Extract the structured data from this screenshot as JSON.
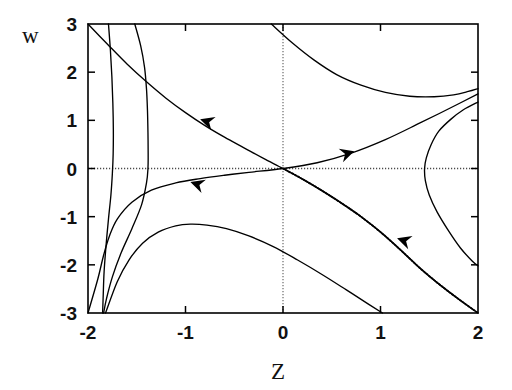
{
  "figure": {
    "name": "phase-portrait",
    "background": "#ffffff",
    "line_color": "#000000",
    "axis_color": "#000000",
    "zero_line_color": "#555555"
  },
  "axes": {
    "xlabel": "Z",
    "ylabel": "w",
    "xticks": [
      "-2",
      "-1",
      "0",
      "1",
      "2"
    ],
    "yticks": [
      "3",
      "2",
      "1",
      "0",
      "-1",
      "-2",
      "-3"
    ],
    "xlim": [
      -2,
      2
    ],
    "ylim": [
      -3,
      3
    ],
    "frame": {
      "left": 88,
      "right": 478,
      "top": 24,
      "bottom": 313
    }
  },
  "chart_data": {
    "type": "line",
    "title": "",
    "xlabel": "Z",
    "ylabel": "w",
    "xlim": [
      -2,
      2
    ],
    "ylim": [
      -3,
      3
    ],
    "grid": false,
    "legend": "none",
    "zero_lines": {
      "horizontal_w": 0,
      "vertical_z": 0,
      "style": "dotted"
    },
    "fixed_point": {
      "z": 0,
      "w": 0,
      "kind": "saddle"
    },
    "annotations": [
      {
        "name": "arrow-upper-left",
        "z": -0.85,
        "w": 1.02,
        "direction": "down-left"
      },
      {
        "name": "arrow-right",
        "z": 0.73,
        "w": 0.36,
        "direction": "right-up"
      },
      {
        "name": "arrow-lower-left",
        "z": -0.95,
        "w": -0.28,
        "direction": "down-left"
      },
      {
        "name": "arrow-separatrix",
        "z": 1.17,
        "w": -1.45,
        "direction": "down-left"
      }
    ],
    "series": [
      {
        "name": "separatrix-stable-branch",
        "style": "solid",
        "points": [
          [
            -2,
            3.0
          ],
          [
            -1.8,
            2.58
          ],
          [
            -1.6,
            2.17
          ],
          [
            -1.4,
            1.8
          ],
          [
            -1.2,
            1.46
          ],
          [
            -1.0,
            1.16
          ],
          [
            -0.8,
            0.89
          ],
          [
            -0.6,
            0.65
          ],
          [
            -0.4,
            0.43
          ],
          [
            -0.2,
            0.21
          ],
          [
            0,
            0
          ],
          [
            0.2,
            -0.22
          ],
          [
            0.4,
            -0.46
          ],
          [
            0.6,
            -0.72
          ],
          [
            0.8,
            -1.0
          ],
          [
            1.0,
            -1.32
          ],
          [
            1.2,
            -1.68
          ],
          [
            1.4,
            -2.06
          ],
          [
            1.6,
            -2.4
          ],
          [
            1.8,
            -2.71
          ],
          [
            2.0,
            -3.0
          ]
        ]
      },
      {
        "name": "separatrix-unstable-branch",
        "style": "solid",
        "points": [
          [
            -2,
            -3.0
          ],
          [
            -1.9,
            -2.3
          ],
          [
            -1.84,
            -1.8
          ],
          [
            -1.78,
            -1.4
          ],
          [
            -1.7,
            -1.05
          ],
          [
            -1.55,
            -0.7
          ],
          [
            -1.35,
            -0.45
          ],
          [
            -1.1,
            -0.3
          ],
          [
            -0.85,
            -0.21
          ],
          [
            -0.6,
            -0.14
          ],
          [
            -0.35,
            -0.08
          ],
          [
            0,
            0
          ],
          [
            0.35,
            0.12
          ],
          [
            0.7,
            0.32
          ],
          [
            1.05,
            0.6
          ],
          [
            1.4,
            0.94
          ],
          [
            1.7,
            1.24
          ],
          [
            2.0,
            1.55
          ]
        ]
      },
      {
        "name": "trajectory-upper-outer",
        "style": "solid",
        "points": [
          [
            -1.52,
            3.0
          ],
          [
            -1.46,
            2.55
          ],
          [
            -1.42,
            2.1
          ],
          [
            -1.4,
            1.65
          ],
          [
            -1.39,
            1.2
          ],
          [
            -1.385,
            0.75
          ],
          [
            -1.383,
            0.3
          ],
          [
            -1.385,
            0.0
          ],
          [
            -1.4,
            -0.3
          ],
          [
            -1.45,
            -0.75
          ],
          [
            -1.55,
            -1.25
          ],
          [
            -1.66,
            -1.75
          ],
          [
            -1.75,
            -2.25
          ],
          [
            -1.81,
            -2.7
          ],
          [
            -1.84,
            -3.0
          ]
        ]
      },
      {
        "name": "trajectory-left-arc",
        "style": "solid",
        "points": [
          [
            -1.79,
            3.0
          ],
          [
            -1.77,
            2.45
          ],
          [
            -1.755,
            1.9
          ],
          [
            -1.745,
            1.35
          ],
          [
            -1.74,
            0.8
          ],
          [
            -1.742,
            0.3
          ],
          [
            -1.75,
            -0.1
          ],
          [
            -1.765,
            -0.55
          ],
          [
            -1.79,
            -1.05
          ],
          [
            -1.815,
            -1.6
          ],
          [
            -1.835,
            -2.15
          ],
          [
            -1.845,
            -2.7
          ],
          [
            -1.85,
            -3.0
          ]
        ]
      },
      {
        "name": "trajectory-lower-hump",
        "style": "solid",
        "points": [
          [
            -1.82,
            -3.0
          ],
          [
            -1.7,
            -2.35
          ],
          [
            -1.58,
            -1.9
          ],
          [
            -1.44,
            -1.55
          ],
          [
            -1.28,
            -1.32
          ],
          [
            -1.1,
            -1.19
          ],
          [
            -0.95,
            -1.155
          ],
          [
            -0.78,
            -1.175
          ],
          [
            -0.58,
            -1.25
          ],
          [
            -0.35,
            -1.4
          ],
          [
            -0.1,
            -1.62
          ],
          [
            0.15,
            -1.9
          ],
          [
            0.4,
            -2.2
          ],
          [
            0.65,
            -2.52
          ],
          [
            0.88,
            -2.82
          ],
          [
            1.02,
            -3.0
          ]
        ]
      },
      {
        "name": "trajectory-upper-right-hyperbola",
        "style": "solid",
        "points": [
          [
            -0.12,
            3.0
          ],
          [
            0.1,
            2.6
          ],
          [
            0.32,
            2.25
          ],
          [
            0.55,
            1.95
          ],
          [
            0.8,
            1.73
          ],
          [
            1.05,
            1.58
          ],
          [
            1.3,
            1.5
          ],
          [
            1.55,
            1.49
          ],
          [
            1.75,
            1.53
          ],
          [
            1.9,
            1.6
          ],
          [
            2.0,
            1.66
          ]
        ]
      },
      {
        "name": "trajectory-right-turning",
        "style": "solid",
        "points": [
          [
            2.0,
            1.38
          ],
          [
            1.85,
            1.22
          ],
          [
            1.72,
            1.02
          ],
          [
            1.6,
            0.78
          ],
          [
            1.52,
            0.5
          ],
          [
            1.47,
            0.22
          ],
          [
            1.452,
            0.0
          ],
          [
            1.46,
            -0.25
          ],
          [
            1.5,
            -0.55
          ],
          [
            1.58,
            -0.9
          ],
          [
            1.7,
            -1.3
          ],
          [
            1.82,
            -1.65
          ],
          [
            1.94,
            -1.92
          ],
          [
            2.0,
            -2.02
          ]
        ]
      }
    ],
    "dotted_curve": {
      "name": "separatrix-stable-branch-dotted-lower",
      "style": "dotted",
      "points": [
        [
          0,
          0
        ],
        [
          0.2,
          -0.22
        ],
        [
          0.4,
          -0.46
        ],
        [
          0.6,
          -0.72
        ],
        [
          0.8,
          -1.0
        ],
        [
          1.0,
          -1.32
        ],
        [
          1.2,
          -1.68
        ],
        [
          1.4,
          -2.06
        ],
        [
          1.6,
          -2.4
        ],
        [
          1.8,
          -2.71
        ],
        [
          2.0,
          -3.0
        ]
      ]
    }
  }
}
